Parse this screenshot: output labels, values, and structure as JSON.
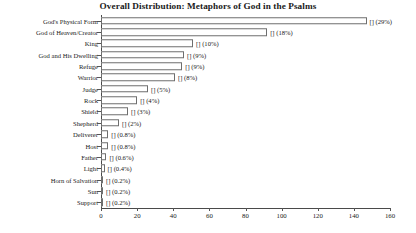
{
  "chart_data": {
    "type": "bar",
    "orientation": "horizontal",
    "title": "Overall Distribution: Metaphors of God in the Psalms",
    "xlabel": "",
    "ylabel": "",
    "xlim": [
      0,
      160
    ],
    "xticks": [
      0,
      20,
      40,
      60,
      80,
      100,
      120,
      140,
      160
    ],
    "grid": false,
    "legend": null,
    "categories": [
      "God's Physical Form",
      "God of Heaven/Creator",
      "King",
      "God and His Dwelling",
      "Refuge",
      "Warrior",
      "Judge",
      "Rock",
      "Shield",
      "Shepherd",
      "Deliverer",
      "Host",
      "Father",
      "Light",
      "Horn of Salvation",
      "Sun",
      "Support"
    ],
    "values": [
      147,
      92,
      51,
      46,
      45,
      41,
      26,
      20,
      15,
      10,
      4,
      4,
      3,
      2,
      1,
      1,
      1
    ],
    "data_labels": [
      "[] (29%)",
      "[] (18%)",
      "[] (10%)",
      "[] (9%)",
      "[] (9%)",
      "[] (8%)",
      "[] (5%)",
      "[] (4%)",
      "[] (3%)",
      "[] (2%)",
      "[] (0.8%)",
      "[] (0.8%)",
      "[] (0.6%)",
      "[] (0.4%)",
      "[] (0.2%)",
      "[] (0.2%)",
      "[] (0.2%)"
    ],
    "percentages": [
      29,
      18,
      10,
      9,
      9,
      8,
      5,
      4,
      3,
      2,
      0.8,
      0.8,
      0.6,
      0.4,
      0.2,
      0.2,
      0.2
    ],
    "colors": {
      "bar_fill": "#ffffff",
      "bar_border": "#6e6e6e",
      "axis": "#4a4a4a",
      "text": "#1a1a1a",
      "background": "#ffffff"
    }
  }
}
